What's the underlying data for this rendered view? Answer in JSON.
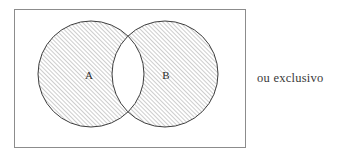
{
  "figure": {
    "name": "venn-diagram-exclusive-or",
    "caption": "ou exclusivo",
    "background_color": "#ffffff"
  },
  "universe_box": {
    "name": "universe-rectangle",
    "x": 14,
    "y": 9,
    "width": 232,
    "height": 139,
    "stroke_color": "#8c8c8c",
    "stroke_width": 1,
    "fill_color": "#ffffff"
  },
  "sets": [
    {
      "id": "A",
      "label": "A",
      "cx": 91,
      "cy": 74,
      "r": 53,
      "label_x": 89,
      "label_y": 75,
      "shaded": true,
      "stroke_color": "#3d3d3d",
      "stroke_width": 1
    },
    {
      "id": "B",
      "label": "B",
      "cx": 165,
      "cy": 74,
      "r": 53,
      "label_x": 166,
      "label_y": 75,
      "shaded": true,
      "stroke_color": "#3d3d3d",
      "stroke_width": 1
    }
  ],
  "intersection": {
    "name": "intersection-lens",
    "shaded": false,
    "fill_color": "#ffffff",
    "description": "A ∩ B left unshaded"
  },
  "hatch": {
    "name": "diagonal-hatch-pattern",
    "angle_degrees": 45,
    "spacing_px": 3,
    "line_color": "#6e6e6e",
    "line_width": 0.7
  },
  "caption": {
    "name": "figure-caption",
    "text": "ou exclusivo",
    "color": "#3a3a3a",
    "x": 257,
    "y": 70
  }
}
